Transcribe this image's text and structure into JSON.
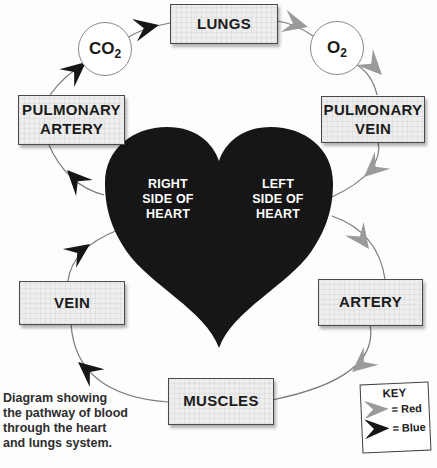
{
  "colors": {
    "arrow_red": "#9a9a9a",
    "arrow_blue": "#161616",
    "heart_fill": "#161616",
    "line": "#7a7a7a",
    "box_fill": "#ededed"
  },
  "boxes": {
    "lungs": {
      "label": "LUNGS"
    },
    "pulmonary_artery": {
      "line1": "PULMONARY",
      "line2": "ARTERY"
    },
    "pulmonary_vein": {
      "line1": "PULMONARY",
      "line2": "VEIN"
    },
    "vein": {
      "label": "VEIN"
    },
    "artery": {
      "label": "ARTERY"
    },
    "muscles": {
      "label": "MUSCLES"
    }
  },
  "gases": {
    "co2": {
      "base": "CO",
      "sub": "2"
    },
    "o2": {
      "base": "O",
      "sub": "2"
    }
  },
  "heart": {
    "right": {
      "line1": "RIGHT",
      "line2": "SIDE OF",
      "line3": "HEART"
    },
    "left": {
      "line1": "LEFT",
      "line2": "SIDE OF",
      "line3": "HEART"
    }
  },
  "caption": {
    "line1": "Diagram showing",
    "line2": "the pathway of blood",
    "line3": "through the heart",
    "line4": "and lungs system."
  },
  "key": {
    "title": "KEY",
    "red_label": "= Red",
    "blue_label": "= Blue"
  }
}
